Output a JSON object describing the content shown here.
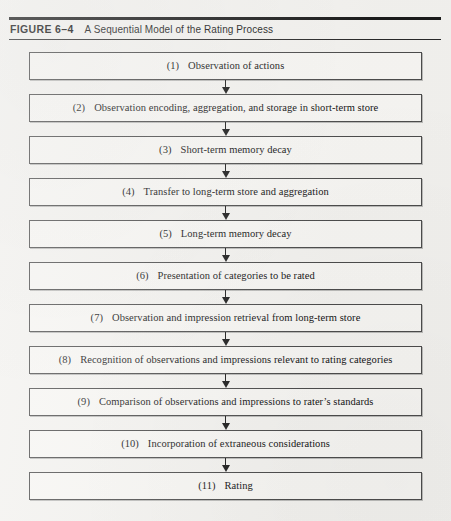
{
  "figure": {
    "label": "FIGURE 6–4",
    "title": "A Sequential Model of the Rating Process"
  },
  "colors": {
    "rule": "#1b1b1b",
    "box_border": "#4c4c4c",
    "text": "#141414",
    "page_background": "#f3f2ef"
  },
  "chart_data": {
    "type": "diagram",
    "diagram_kind": "vertical-flowchart",
    "title": "A Sequential Model of the Rating Process",
    "node_count": 11,
    "connector": "downward-arrow",
    "nodes": [
      {
        "num": "(1)",
        "label": "Observation of actions"
      },
      {
        "num": "(2)",
        "label": "Observation encoding, aggregation, and storage in short-term store"
      },
      {
        "num": "(3)",
        "label": "Short-term memory decay"
      },
      {
        "num": "(4)",
        "label": "Transfer to long-term store and aggregation"
      },
      {
        "num": "(5)",
        "label": "Long-term memory decay"
      },
      {
        "num": "(6)",
        "label": "Presentation of categories to be rated"
      },
      {
        "num": "(7)",
        "label": "Observation and impression retrieval from long-term store"
      },
      {
        "num": "(8)",
        "label": "Recognition of observations and impressions relevant to rating categories"
      },
      {
        "num": "(9)",
        "label": "Comparison of observations and impressions to rater’s standards"
      },
      {
        "num": "(10)",
        "label": "Incorporation of extraneous considerations"
      },
      {
        "num": "(11)",
        "label": "Rating"
      }
    ]
  }
}
